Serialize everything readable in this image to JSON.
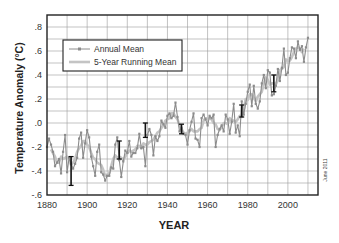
{
  "chart_data": {
    "type": "line",
    "title": "",
    "xlabel": "YEAR",
    "ylabel": "Temperature Anomaly (°C)",
    "xlim": [
      1880,
      2015
    ],
    "ylim": [
      -0.6,
      0.9
    ],
    "grid": true,
    "legend_position": "upper-left",
    "x_ticks": [
      1880,
      1900,
      1920,
      1940,
      1960,
      1980,
      2000
    ],
    "x_tick_labels": [
      "1880",
      "1900",
      "1920",
      "1940",
      "1960",
      "1980",
      "2000"
    ],
    "y_ticks": [
      0.8,
      0.6,
      0.4,
      0.2,
      0.0,
      -0.2,
      -0.4,
      -0.6
    ],
    "y_tick_labels": [
      ".8",
      ".6",
      ".4",
      ".2",
      ".0",
      "-.2",
      "-.4",
      "-.6"
    ],
    "annotation": "June 2011",
    "x": [
      1880,
      1881,
      1882,
      1883,
      1884,
      1885,
      1886,
      1887,
      1888,
      1889,
      1890,
      1891,
      1892,
      1893,
      1894,
      1895,
      1896,
      1897,
      1898,
      1899,
      1900,
      1901,
      1902,
      1903,
      1904,
      1905,
      1906,
      1907,
      1908,
      1909,
      1910,
      1911,
      1912,
      1913,
      1914,
      1915,
      1916,
      1917,
      1918,
      1919,
      1920,
      1921,
      1922,
      1923,
      1924,
      1925,
      1926,
      1927,
      1928,
      1929,
      1930,
      1931,
      1932,
      1933,
      1934,
      1935,
      1936,
      1937,
      1938,
      1939,
      1940,
      1941,
      1942,
      1943,
      1944,
      1945,
      1946,
      1947,
      1948,
      1949,
      1950,
      1951,
      1952,
      1953,
      1954,
      1955,
      1956,
      1957,
      1958,
      1959,
      1960,
      1961,
      1962,
      1963,
      1964,
      1965,
      1966,
      1967,
      1968,
      1969,
      1970,
      1971,
      1972,
      1973,
      1974,
      1975,
      1976,
      1977,
      1978,
      1979,
      1980,
      1981,
      1982,
      1983,
      1984,
      1985,
      1986,
      1987,
      1988,
      1989,
      1990,
      1991,
      1992,
      1993,
      1994,
      1995,
      1996,
      1997,
      1998,
      1999,
      2000,
      2001,
      2002,
      2003,
      2004,
      2005,
      2006,
      2007,
      2008,
      2009,
      2010
    ],
    "series": [
      {
        "name": "Annual Mean",
        "color": "#8c8c8c",
        "values": [
          -0.2,
          -0.13,
          -0.18,
          -0.24,
          -0.36,
          -0.33,
          -0.3,
          -0.42,
          -0.24,
          -0.1,
          -0.41,
          -0.29,
          -0.34,
          -0.38,
          -0.34,
          -0.29,
          -0.13,
          -0.08,
          -0.29,
          -0.17,
          -0.06,
          -0.12,
          -0.28,
          -0.36,
          -0.44,
          -0.24,
          -0.18,
          -0.41,
          -0.43,
          -0.48,
          -0.44,
          -0.44,
          -0.37,
          -0.38,
          -0.18,
          -0.12,
          -0.31,
          -0.45,
          -0.32,
          -0.23,
          -0.25,
          -0.15,
          -0.28,
          -0.25,
          -0.25,
          -0.21,
          -0.09,
          -0.21,
          -0.2,
          -0.36,
          -0.1,
          -0.05,
          -0.1,
          -0.27,
          -0.11,
          -0.15,
          -0.11,
          0.02,
          -0.01,
          -0.04,
          0.06,
          0.08,
          0.04,
          0.06,
          0.17,
          0.05,
          -0.07,
          -0.04,
          -0.09,
          -0.1,
          -0.18,
          -0.06,
          0.01,
          0.08,
          -0.13,
          -0.14,
          -0.2,
          0.04,
          0.07,
          0.03,
          -0.02,
          0.06,
          0.04,
          0.07,
          -0.2,
          -0.1,
          -0.05,
          -0.02,
          -0.07,
          0.07,
          0.03,
          -0.09,
          0.01,
          0.16,
          -0.08,
          -0.02,
          -0.11,
          0.18,
          0.07,
          0.16,
          0.26,
          0.32,
          0.14,
          0.31,
          0.16,
          0.12,
          0.18,
          0.33,
          0.4,
          0.29,
          0.44,
          0.42,
          0.23,
          0.24,
          0.31,
          0.45,
          0.35,
          0.46,
          0.62,
          0.4,
          0.42,
          0.54,
          0.63,
          0.62,
          0.54,
          0.68,
          0.61,
          0.64,
          0.51,
          0.63,
          0.71
        ]
      },
      {
        "name": "5-Year Running Mean",
        "color": "#c4c4c4",
        "values": [
          null,
          null,
          -0.22,
          -0.25,
          -0.28,
          -0.33,
          -0.33,
          -0.28,
          -0.3,
          -0.29,
          -0.28,
          -0.3,
          -0.35,
          -0.33,
          -0.3,
          -0.24,
          -0.21,
          -0.19,
          -0.15,
          -0.15,
          -0.18,
          -0.2,
          -0.25,
          -0.29,
          -0.3,
          -0.33,
          -0.34,
          -0.35,
          -0.39,
          -0.44,
          -0.43,
          -0.42,
          -0.36,
          -0.3,
          -0.27,
          -0.29,
          -0.28,
          -0.29,
          -0.31,
          -0.28,
          -0.25,
          -0.23,
          -0.24,
          -0.23,
          -0.22,
          -0.19,
          -0.19,
          -0.21,
          -0.17,
          -0.18,
          -0.18,
          -0.16,
          -0.15,
          -0.14,
          -0.11,
          -0.08,
          -0.07,
          -0.04,
          -0.02,
          0.02,
          0.03,
          0.04,
          0.08,
          0.08,
          0.05,
          0.03,
          -0.02,
          -0.05,
          -0.08,
          -0.09,
          -0.08,
          -0.07,
          -0.05,
          -0.07,
          -0.07,
          -0.07,
          -0.05,
          -0.04,
          0.02,
          0.04,
          0.04,
          0.04,
          0.03,
          0.0,
          -0.01,
          -0.05,
          -0.06,
          -0.03,
          0.0,
          0.0,
          -0.01,
          0.04,
          0.02,
          0.02,
          0.01,
          0.03,
          0.06,
          0.05,
          0.11,
          0.2,
          0.19,
          0.24,
          0.24,
          0.21,
          0.18,
          0.22,
          0.24,
          0.26,
          0.33,
          0.38,
          0.36,
          0.32,
          0.33,
          0.33,
          0.32,
          0.36,
          0.44,
          0.45,
          0.47,
          0.53,
          0.52,
          0.52,
          0.55,
          0.59,
          0.62,
          0.63,
          0.62,
          0.59,
          0.62,
          null,
          null
        ]
      }
    ],
    "error_bars": [
      {
        "year": 1892,
        "low": -0.52,
        "high": -0.28
      },
      {
        "year": 1916,
        "low": -0.3,
        "high": -0.15
      },
      {
        "year": 1929,
        "low": -0.12,
        "high": 0.0
      },
      {
        "year": 1947,
        "low": -0.09,
        "high": -0.01
      },
      {
        "year": 1977,
        "low": 0.05,
        "high": 0.15
      },
      {
        "year": 1993,
        "low": 0.26,
        "high": 0.4
      }
    ]
  },
  "legend": {
    "items": [
      {
        "label": "Annual Mean",
        "style": "line-with-dots"
      },
      {
        "label": "5-Year Running Mean",
        "style": "thick-line"
      }
    ]
  },
  "colors": {
    "annual": "#8c8c8c",
    "running": "#c4c4c4",
    "error_bar": "#111111",
    "grid": "#9a9a9a",
    "frame": "#222222"
  }
}
